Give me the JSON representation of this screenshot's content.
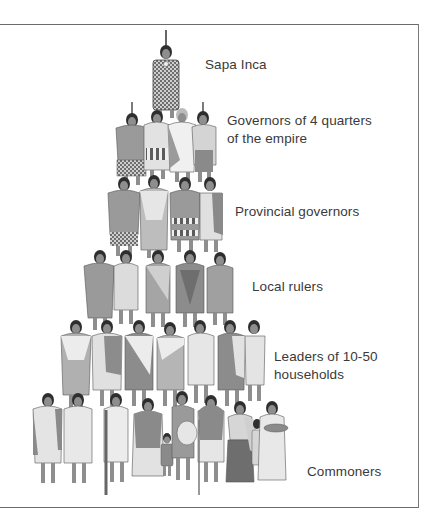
{
  "diagram": {
    "type": "social-hierarchy-pyramid",
    "colors": {
      "frame": "#6b6b6b",
      "text": "#3a3a3a",
      "dark_cloth": "#7d7d7d",
      "mid_cloth": "#a3a3a3",
      "light_cloth": "#d9d9d9",
      "skin": "#8e8e8e",
      "hair": "#2e2e2e"
    },
    "levels": [
      {
        "id": "sapa-inca",
        "lines": [
          "Sapa Inca"
        ],
        "figure_count": 1
      },
      {
        "id": "governors-4-quarters",
        "lines": [
          "Governors of 4 quarters",
          "of the empire"
        ],
        "figure_count": 4
      },
      {
        "id": "provincial-governors",
        "lines": [
          "Provincial governors"
        ],
        "figure_count": 4
      },
      {
        "id": "local-rulers",
        "lines": [
          "Local rulers"
        ],
        "figure_count": 5
      },
      {
        "id": "leaders-10-50",
        "lines": [
          "Leaders of 10-50",
          "households"
        ],
        "figure_count": 7
      },
      {
        "id": "commoners",
        "lines": [
          "Commoners"
        ],
        "figure_count": 10
      }
    ]
  }
}
